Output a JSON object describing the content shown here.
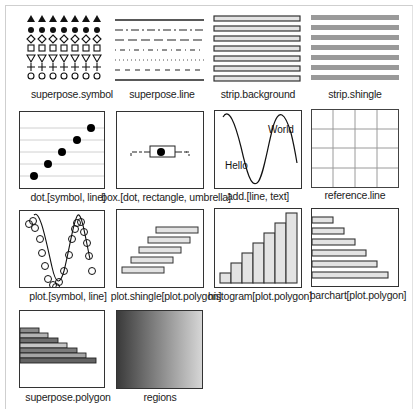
{
  "panels": [
    {
      "id": "superpose-symbol",
      "label": "superpose.symbol",
      "symbols": [
        "filled-triangle",
        "filled-circle",
        "open-diamond",
        "open-square",
        "open-inverted-triangle",
        "plus",
        "open-circle"
      ],
      "columns": 7
    },
    {
      "id": "superpose-line",
      "label": "superpose.line",
      "line_styles": [
        "solid",
        "dash-dot",
        "long-dash",
        "dot-dash",
        "dotted",
        "dashed",
        "solid"
      ]
    },
    {
      "id": "strip-background",
      "label": "strip.background",
      "strip_count": 7,
      "fill": "#e3e3e3"
    },
    {
      "id": "strip-shingle",
      "label": "strip.shingle",
      "strip_count": 7,
      "fill": "#9a9a9a"
    },
    {
      "id": "dot-symbol-line",
      "label": "dot.[symbol, line]",
      "points": 5
    },
    {
      "id": "box-dot-rectangle-umbrella",
      "label": "box.[dot, rectangle, umbrella]"
    },
    {
      "id": "add-line-text",
      "label": "add.[line, text]",
      "text_hello": "Hello",
      "text_world": "World"
    },
    {
      "id": "reference-line",
      "label": "reference.line",
      "grid": "4x4"
    },
    {
      "id": "plot-symbol-line",
      "label": "plot.[symbol, line]"
    },
    {
      "id": "plot-shingle",
      "label": "plot.shingle[plot.polygon]",
      "bars": 5
    },
    {
      "id": "histogram",
      "label": "histogram[plot.polygon]",
      "bars": 7
    },
    {
      "id": "barchart",
      "label": "barchart[plot.polygon]",
      "bars": 6
    },
    {
      "id": "superpose-polygon",
      "label": "superpose.polygon",
      "bars": 7
    },
    {
      "id": "regions",
      "label": "regions",
      "gradient": [
        "#3a3a3a",
        "#d6d6d6"
      ]
    }
  ],
  "colors": {
    "border": "#333333",
    "light_fill": "#e3e3e3",
    "shingle_fill": "#9a9a9a",
    "ref_line": "#9a9a9a",
    "dot_line": "#d0d0d0"
  }
}
